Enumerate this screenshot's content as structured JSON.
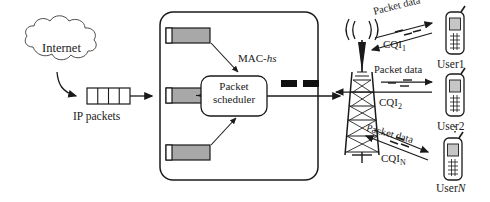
{
  "diagram": {
    "colors": {
      "stroke": "#1a1a1a",
      "buffer_fill": "#a8a8a8",
      "block_fill": "#111111",
      "background": "#ffffff"
    }
  },
  "cloud": {
    "label": "Internet",
    "icon": "cloud-icon"
  },
  "ingress": {
    "queue_label": "IP packets",
    "queue_icon": "packet-queue-icon",
    "segments": 4
  },
  "mac_hs": {
    "label_prefix": "MAC-",
    "label_italic": "hs",
    "entity_icon": "rounded-box",
    "buffers": [
      {
        "name": "priority-queue-1"
      },
      {
        "name": "priority-queue-2"
      },
      {
        "name": "priority-queue-3"
      }
    ],
    "scheduler": {
      "line1": "Packet",
      "line2": "scheduler",
      "icon": "scheduler-box"
    },
    "output_blocks": 2
  },
  "base_station": {
    "icon": "antenna-tower-icon",
    "waves_icon": "radio-waves-icon"
  },
  "links": [
    {
      "id": "link-user-1",
      "downlink_label": "Packet data",
      "uplink_label_text": "CQI",
      "uplink_label_sub": "1"
    },
    {
      "id": "link-user-2",
      "downlink_label": "Packet data",
      "uplink_label_text": "CQI",
      "uplink_label_sub": "2"
    },
    {
      "id": "link-user-n",
      "downlink_label": "Packet data",
      "uplink_label_text": "CQI",
      "uplink_label_sub": "N"
    }
  ],
  "users": [
    {
      "id": "user-1",
      "label_prefix": "User",
      "label_suffix": "1",
      "italic_suffix": false,
      "icon": "mobile-phone-icon"
    },
    {
      "id": "user-2",
      "label_prefix": "User",
      "label_suffix": "2",
      "italic_suffix": false,
      "icon": "mobile-phone-icon"
    },
    {
      "id": "user-n",
      "label_prefix": "User",
      "label_suffix": "N",
      "italic_suffix": true,
      "icon": "mobile-phone-icon"
    }
  ],
  "continuation": {
    "icon": "vertical-dots-icon"
  }
}
